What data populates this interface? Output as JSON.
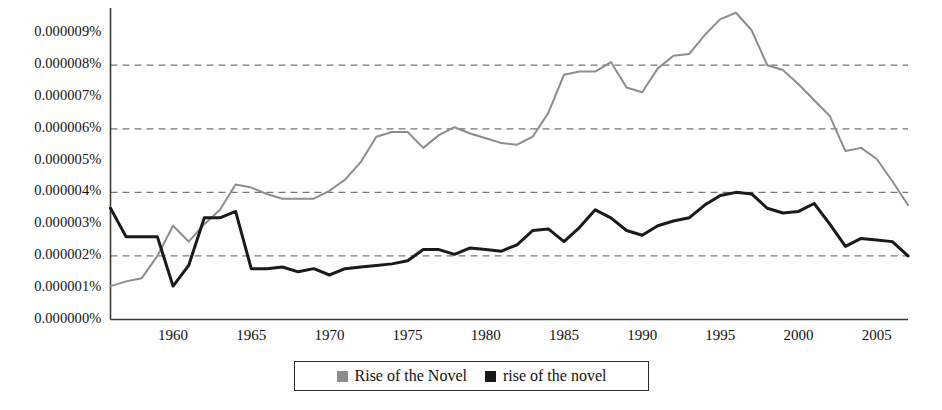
{
  "chart_data": {
    "type": "line",
    "title": "",
    "xlabel": "",
    "ylabel": "",
    "grid": "horizontal dashed gridlines at 0.000002%, 0.000004%, 0.000006%, 0.000008%",
    "legend_position": "bottom-center",
    "xlim": [
      1956,
      2007
    ],
    "ylim": [
      0,
      9.8
    ],
    "y_unit": "percent (millionths)",
    "y_tick_labels": [
      "0.000000%",
      "0.000001%",
      "0.000002%",
      "0.000003%",
      "0.000004%",
      "0.000005%",
      "0.000006%",
      "0.000007%",
      "0.000008%",
      "0.000009%"
    ],
    "y_tick_values": [
      0,
      1,
      2,
      3,
      4,
      5,
      6,
      7,
      8,
      9
    ],
    "x_tick_labels": [
      "1960",
      "1965",
      "1970",
      "1975",
      "1980",
      "1985",
      "1990",
      "1995",
      "2000",
      "2005"
    ],
    "x_tick_values": [
      1960,
      1965,
      1970,
      1975,
      1980,
      1985,
      1990,
      1995,
      2000,
      2005
    ],
    "x": [
      1956,
      1957,
      1958,
      1959,
      1960,
      1961,
      1962,
      1963,
      1964,
      1965,
      1966,
      1967,
      1968,
      1969,
      1970,
      1971,
      1972,
      1973,
      1974,
      1975,
      1976,
      1977,
      1978,
      1979,
      1980,
      1981,
      1982,
      1983,
      1984,
      1985,
      1986,
      1987,
      1988,
      1989,
      1990,
      1991,
      1992,
      1993,
      1994,
      1995,
      1996,
      1997,
      1998,
      1999,
      2000,
      2001,
      2002,
      2003,
      2004,
      2005,
      2006,
      2007
    ],
    "series": [
      {
        "name": "Rise of the Novel",
        "color": "#8d8d8d",
        "values": [
          1.05,
          1.2,
          1.3,
          2.0,
          2.95,
          2.45,
          3.0,
          3.45,
          4.25,
          4.15,
          3.95,
          3.8,
          3.8,
          3.8,
          4.05,
          4.4,
          4.95,
          5.75,
          5.9,
          5.9,
          5.4,
          5.8,
          6.05,
          5.85,
          5.7,
          5.55,
          5.5,
          5.75,
          6.5,
          7.7,
          7.8,
          7.8,
          8.1,
          7.3,
          7.15,
          7.9,
          8.3,
          8.35,
          8.95,
          9.45,
          9.65,
          9.1,
          8.0,
          7.85,
          7.4,
          6.9,
          6.4,
          5.3,
          5.4,
          5.05,
          4.35,
          3.6
        ]
      },
      {
        "name": "rise of the novel",
        "color": "#1a1a1a",
        "values": [
          3.5,
          2.6,
          2.6,
          2.6,
          1.05,
          1.7,
          3.2,
          3.2,
          3.4,
          1.6,
          1.6,
          1.65,
          1.5,
          1.6,
          1.4,
          1.6,
          1.65,
          1.7,
          1.75,
          1.85,
          2.2,
          2.2,
          2.05,
          2.25,
          2.2,
          2.15,
          2.35,
          2.8,
          2.85,
          2.45,
          2.9,
          3.45,
          3.2,
          2.8,
          2.65,
          2.95,
          3.1,
          3.2,
          3.6,
          3.9,
          4.0,
          3.95,
          3.5,
          3.35,
          3.4,
          3.65,
          3.0,
          2.3,
          2.55,
          2.5,
          2.45,
          2.0
        ]
      }
    ]
  },
  "legend": {
    "entries": [
      {
        "label": "Rise of the Novel",
        "swatch_color": "#8d8d8d",
        "icon": "legend-square-icon"
      },
      {
        "label": "rise of the novel",
        "swatch_color": "#1a1a1a",
        "icon": "legend-square-icon"
      }
    ]
  }
}
